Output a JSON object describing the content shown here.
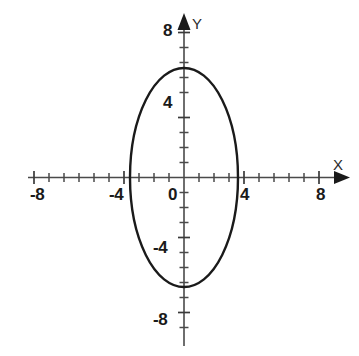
{
  "figure": {
    "background_color": "#ffffff",
    "ink_color": "#1a1a1a",
    "axis_color": "#4a4a4a"
  },
  "axis_names": {
    "x": "X",
    "y": "Y"
  },
  "x_labels": {
    "neg8": "-8",
    "neg4": "-4",
    "zero": "0",
    "pos4": "4",
    "pos8": "8"
  },
  "y_labels": {
    "pos8": "8",
    "pos4": "4",
    "neg4": "-4",
    "neg8": "-8"
  },
  "chart_data": {
    "type": "line",
    "title": "",
    "subtitle": "",
    "xlabel": "X",
    "ylabel": "Y",
    "xlim": [
      -9,
      9
    ],
    "ylim": [
      -9.5,
      9
    ],
    "grid": false,
    "legend": null,
    "x_ticks": [
      -8,
      -7,
      -6,
      -5,
      -4,
      -3,
      -2,
      -1,
      0,
      1,
      2,
      3,
      4,
      5,
      6,
      7,
      8
    ],
    "x_tick_labels": [
      "-8",
      "",
      "",
      "",
      "-4",
      "",
      "",
      "",
      "0",
      "",
      "",
      "",
      "4",
      "",
      "",
      "",
      "8"
    ],
    "y_ticks": [
      -8,
      -7,
      -6,
      -5,
      -4,
      -3,
      -2,
      -1,
      0,
      1,
      2,
      3,
      4,
      5,
      6,
      7,
      8
    ],
    "y_tick_labels": [
      "-8",
      "",
      "",
      "",
      "-4",
      "",
      "",
      "",
      "0",
      "",
      "",
      "",
      "4",
      "",
      "",
      "",
      "8"
    ],
    "series": [
      {
        "name": "ellipse",
        "shape": "ellipse",
        "center": [
          0,
          0
        ],
        "semi_axis_x": 3.6,
        "semi_axis_y": 7.3,
        "x_intercepts": [
          -3.6,
          3.6
        ],
        "y_intercepts": [
          -7.3,
          7.3
        ],
        "equation": "x^2/13 + y^2/53 = 1",
        "stroke": "#1a1a1a",
        "fill": "none"
      }
    ],
    "annotations": []
  }
}
